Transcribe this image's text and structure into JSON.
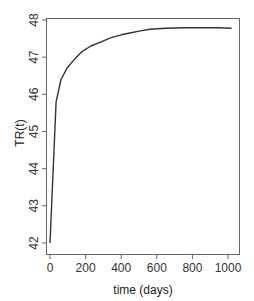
{
  "chart_data": {
    "type": "line",
    "title": "",
    "xlabel": "time (days)",
    "ylabel": "TR(t)",
    "xlim": [
      -40,
      1060
    ],
    "ylim": [
      41.9,
      48.05
    ],
    "xticks": [
      0,
      200,
      400,
      600,
      800,
      1000
    ],
    "xtick_labels": [
      "0",
      "200",
      "400",
      "600",
      "800",
      "1000"
    ],
    "yticks": [
      42,
      43,
      44,
      45,
      46,
      47,
      48
    ],
    "ytick_labels": [
      "42",
      "43",
      "44",
      "45",
      "46",
      "47",
      "48"
    ],
    "grid": false,
    "legend": null,
    "series": [
      {
        "name": "TR(t)",
        "color": "#333333",
        "x": [
          0,
          34,
          62,
          95,
          129,
          180,
          230,
          281,
          340,
          400,
          449,
          500,
          562,
          650,
          750,
          850,
          950,
          1020
        ],
        "y": [
          42.0,
          45.8,
          46.4,
          46.7,
          46.9,
          47.15,
          47.3,
          47.4,
          47.52,
          47.6,
          47.65,
          47.7,
          47.75,
          47.78,
          47.79,
          47.79,
          47.79,
          47.78
        ]
      }
    ]
  }
}
